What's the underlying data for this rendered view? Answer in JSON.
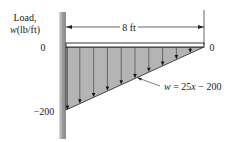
{
  "diagram": {
    "y_axis_label_line1": "Load,",
    "y_axis_label_line2_var": "w",
    "y_axis_label_line2_unit": "(lb/ft)",
    "dimension_label": "8 ft",
    "left_zero_label": "0",
    "right_zero_label": "0",
    "min_load_label": "−200",
    "equation": {
      "var": "w",
      "eq": " = 25",
      "x": "x",
      "rest": " − 200"
    },
    "length_ft": 8,
    "load_at_left": -200,
    "load_at_right": 0,
    "slope": 25,
    "intercept": -200,
    "arrow_count": 10,
    "colors": {
      "fill": "#b4b4b4",
      "line": "#222222",
      "wall_dark": "#8a8a8a",
      "wall_light": "#d8d8d8"
    }
  }
}
